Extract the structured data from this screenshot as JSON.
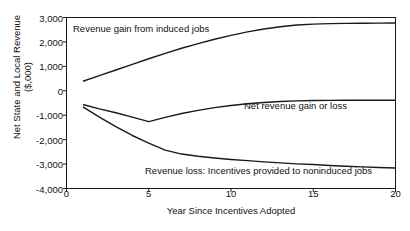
{
  "chart_data": {
    "type": "line",
    "title": "",
    "xlabel": "Year Since Incentives Adopted",
    "ylabel": "Net State and Local Revenue\n($,000)",
    "xlim": [
      0,
      20
    ],
    "ylim": [
      -4000,
      3000
    ],
    "xticks": [
      0,
      5,
      10,
      15,
      20
    ],
    "xtick_labels": [
      "0",
      "5",
      "10",
      "15",
      "20"
    ],
    "yticks": [
      3000,
      2000,
      1000,
      0,
      -1000,
      -2000,
      -3000,
      -4000
    ],
    "ytick_labels": [
      "3,000",
      "2,000",
      "1,000",
      "0",
      "-1,000",
      "-2,000",
      "-3,000",
      "-4,000"
    ],
    "grid": false,
    "legend_position": "inline-annotations",
    "line_color": "#1a1a1a",
    "x": [
      1,
      2,
      3,
      4,
      5,
      6,
      7,
      8,
      9,
      10,
      11,
      12,
      13,
      14,
      15,
      16,
      17,
      18,
      19,
      20
    ],
    "series": [
      {
        "name": "Revenue gain from induced jobs",
        "values": [
          390,
          620,
          850,
          1080,
          1310,
          1530,
          1740,
          1930,
          2110,
          2270,
          2410,
          2530,
          2620,
          2690,
          2730,
          2750,
          2760,
          2765,
          2770,
          2775
        ]
      },
      {
        "name": "Net revenue gain or loss",
        "values": [
          -560,
          -740,
          -900,
          -1080,
          -1260,
          -1090,
          -930,
          -800,
          -690,
          -600,
          -530,
          -480,
          -440,
          -415,
          -400,
          -393,
          -390,
          -390,
          -390,
          -390
        ]
      },
      {
        "name": "Revenue loss: Incentives provided to noninduced jobs",
        "values": [
          -660,
          -1080,
          -1470,
          -1830,
          -2140,
          -2430,
          -2590,
          -2680,
          -2750,
          -2810,
          -2860,
          -2910,
          -2950,
          -2990,
          -3020,
          -3060,
          -3090,
          -3115,
          -3140,
          -3160
        ]
      }
    ],
    "annotations": [
      {
        "text": "Revenue gain from induced jobs",
        "x": 1.4,
        "y": 2650
      },
      {
        "text": "Net revenue gain or loss",
        "x": 11.8,
        "y": -400
      },
      {
        "text": "Revenue loss: Incentives provided to noninduced jobs",
        "x": 5.2,
        "y": -3150
      }
    ]
  }
}
